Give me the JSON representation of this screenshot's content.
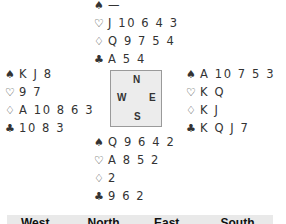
{
  "hands": {
    "north": {
      "spades": "—",
      "hearts": "J 10 6 4 3",
      "diamonds": "Q 9 7 5 4",
      "clubs": "A 5 4"
    },
    "west": {
      "spades": "K J 8",
      "hearts": "9 7",
      "diamonds": "A 10 8 6 3",
      "clubs": "10 8 3"
    },
    "east": {
      "spades": "A 10 7 5 3",
      "hearts": "K Q",
      "diamonds": "K J",
      "clubs": "K Q J 7"
    },
    "south": {
      "spades": "Q 9 6 4 2",
      "hearts": "A 8 5 2",
      "diamonds": "2",
      "clubs": "9 6 2"
    }
  },
  "suit_symbols": {
    "spades": "♠",
    "hearts": "♡",
    "diamonds": "♢",
    "clubs": "♣"
  },
  "compass": {
    "n": "N",
    "w": "W",
    "e": "E",
    "s": "S"
  },
  "auction_header": [
    "West",
    "North",
    "East",
    "South"
  ]
}
